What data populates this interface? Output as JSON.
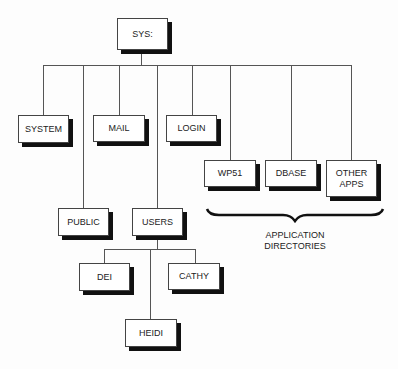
{
  "diagram": {
    "type": "directory-tree",
    "root": {
      "label": "SYS:"
    },
    "nodes": {
      "system": {
        "label": "SYSTEM"
      },
      "public": {
        "label": "PUBLIC"
      },
      "mail": {
        "label": "MAIL"
      },
      "users": {
        "label": "USERS"
      },
      "login": {
        "label": "LOGIN"
      },
      "wp51": {
        "label": "WP51"
      },
      "dbase": {
        "label": "DBASE"
      },
      "other_apps": {
        "label": "OTHER\nAPPS"
      },
      "dei": {
        "label": "DEI"
      },
      "cathy": {
        "label": "CATHY"
      },
      "heidi": {
        "label": "HEIDI"
      }
    },
    "edges": [
      [
        "SYS:",
        "SYSTEM"
      ],
      [
        "SYS:",
        "PUBLIC"
      ],
      [
        "SYS:",
        "MAIL"
      ],
      [
        "SYS:",
        "USERS"
      ],
      [
        "SYS:",
        "LOGIN"
      ],
      [
        "SYS:",
        "WP51"
      ],
      [
        "SYS:",
        "DBASE"
      ],
      [
        "SYS:",
        "OTHER APPS"
      ],
      [
        "USERS",
        "DEI"
      ],
      [
        "USERS",
        "HEIDI"
      ],
      [
        "USERS",
        "CATHY"
      ]
    ],
    "group_label": "APPLICATION\nDIRECTORIES",
    "group_members": [
      "WP51",
      "DBASE",
      "OTHER APPS"
    ]
  }
}
